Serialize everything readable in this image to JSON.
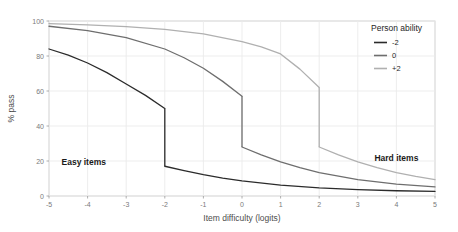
{
  "chart_data": {
    "type": "line",
    "title": "",
    "xlabel": "Item difficulty (logits)",
    "ylabel": "% pass",
    "xlim": [
      -5,
      5
    ],
    "ylim": [
      0,
      100
    ],
    "xticks": [
      -5,
      -4,
      -3,
      -2,
      -1,
      0,
      1,
      2,
      3,
      4,
      5
    ],
    "xticklabels": [
      "-5",
      "-4",
      "-3",
      "-2",
      "-1",
      "0",
      "1",
      "2",
      "3",
      "4",
      "5"
    ],
    "yticks": [
      0,
      20,
      40,
      60,
      80,
      100
    ],
    "yticklabels": [
      "0",
      "20",
      "40",
      "60",
      "80",
      "100"
    ],
    "grid": true,
    "legend": {
      "title": "Person ability",
      "position": "top-right-inside",
      "entries": [
        {
          "label": "-2",
          "color": "#2b2b2b"
        },
        {
          "label": "0",
          "color": "#6e6e6e"
        },
        {
          "label": "+2",
          "color": "#b0b0b0"
        }
      ]
    },
    "annotations": [
      {
        "text": "Easy items",
        "x": -4.1,
        "y": 18
      },
      {
        "text": "Hard items",
        "x": 4.0,
        "y": 20
      }
    ],
    "series": [
      {
        "name": "-2",
        "color": "#2b2b2b",
        "discontinuity_x": -2,
        "segments": [
          {
            "x": [
              -5,
              -4.5,
              -4,
              -3.5,
              -3,
              -2.5,
              -2
            ],
            "y": [
              84,
              80.5,
              76,
              70.5,
              64,
              57.5,
              50
            ]
          },
          {
            "x": [
              -2,
              -1.5,
              -1,
              -0.5,
              0,
              1,
              2,
              3,
              4,
              5
            ],
            "y": [
              17,
              14.5,
              12.2,
              10.2,
              8.6,
              6.2,
              4.6,
              3.6,
              3.0,
              2.6
            ]
          }
        ]
      },
      {
        "name": "0",
        "color": "#6e6e6e",
        "discontinuity_x": 0,
        "segments": [
          {
            "x": [
              -5,
              -4,
              -3,
              -2,
              -1.5,
              -1,
              -0.5,
              0
            ],
            "y": [
              97,
              94.5,
              90.5,
              84,
              79,
              73,
              65.5,
              57
            ]
          },
          {
            "x": [
              0,
              0.5,
              1,
              1.5,
              2,
              3,
              4,
              5
            ],
            "y": [
              28,
              23.5,
              19.5,
              16.2,
              13.4,
              9.4,
              6.8,
              5.2
            ]
          }
        ]
      },
      {
        "name": "+2",
        "color": "#b0b0b0",
        "discontinuity_x": 2,
        "segments": [
          {
            "x": [
              -5,
              -4,
              -3,
              -2,
              -1,
              0,
              0.5,
              1,
              1.5,
              2
            ],
            "y": [
              98.5,
              97.8,
              96.8,
              95.2,
              92.6,
              88.2,
              85.2,
              81.2,
              72.5,
              62
            ]
          },
          {
            "x": [
              2,
              2.5,
              3,
              3.5,
              4,
              4.5,
              5
            ],
            "y": [
              28,
              23.5,
              19.5,
              16.2,
              13.4,
              11.2,
              9.4
            ]
          }
        ]
      }
    ]
  }
}
